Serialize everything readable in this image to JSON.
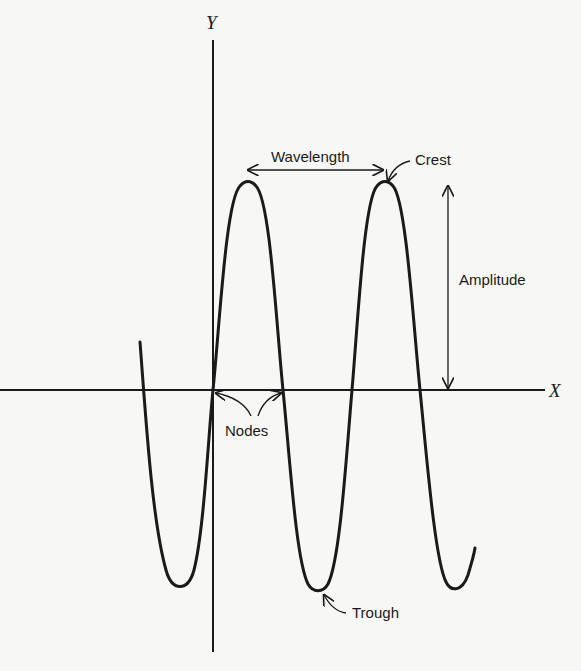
{
  "diagram": {
    "axes": {
      "x_label": "X",
      "y_label": "Y"
    },
    "labels": {
      "wavelength": "Wavelength",
      "crest": "Crest",
      "amplitude": "Amplitude",
      "nodes": "Nodes",
      "trough": "Trough"
    },
    "colors": {
      "ink": "#1a1a1a",
      "paper": "#f7f7f5"
    }
  }
}
